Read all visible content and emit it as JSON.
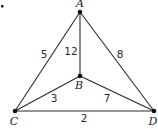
{
  "diagram": {
    "type": "weighted-graph",
    "corner_mark": ".",
    "nodes": [
      {
        "id": "A",
        "label": "A",
        "x": 80,
        "y": 12,
        "label_x": 80,
        "label_y": 7
      },
      {
        "id": "B",
        "label": "B",
        "x": 80,
        "y": 76,
        "label_x": 79,
        "label_y": 89
      },
      {
        "id": "C",
        "label": "C",
        "x": 15,
        "y": 111,
        "label_x": 14,
        "label_y": 125
      },
      {
        "id": "D",
        "label": "D",
        "x": 154,
        "y": 111,
        "label_x": 153,
        "label_y": 125
      }
    ],
    "edges": [
      {
        "from": "A",
        "to": "C",
        "weight": "5",
        "label_x": 44,
        "label_y": 58
      },
      {
        "from": "A",
        "to": "B",
        "weight": "12",
        "label_x": 71,
        "label_y": 55
      },
      {
        "from": "A",
        "to": "D",
        "weight": "8",
        "label_x": 120,
        "label_y": 58
      },
      {
        "from": "B",
        "to": "C",
        "weight": "3",
        "label_x": 54,
        "label_y": 102
      },
      {
        "from": "B",
        "to": "D",
        "weight": "7",
        "label_x": 107,
        "label_y": 102
      },
      {
        "from": "C",
        "to": "D",
        "weight": "2",
        "label_x": 84,
        "label_y": 122
      }
    ]
  }
}
